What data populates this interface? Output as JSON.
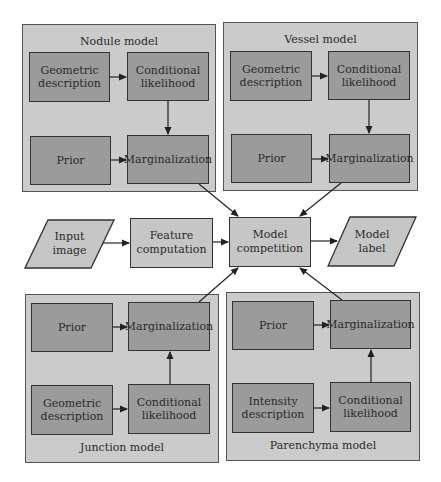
{
  "panels": {
    "nodule": {
      "title": "Nodule model",
      "boxes": {
        "description": "Geometric description",
        "likelihood": "Conditional likelihood",
        "prior": "Prior",
        "marginalization": "Marginalization"
      }
    },
    "vessel": {
      "title": "Vessel model",
      "boxes": {
        "description": "Geometric description",
        "likelihood": "Conditional likelihood",
        "prior": "Prior",
        "marginalization": "Marginalization"
      }
    },
    "junction": {
      "title": "Junction model",
      "boxes": {
        "description": "Geometric description",
        "likelihood": "Conditional likelihood",
        "prior": "Prior",
        "marginalization": "Marginalization"
      }
    },
    "parenchyma": {
      "title": "Parenchyma model",
      "boxes": {
        "description": "Intensity description",
        "likelihood": "Conditional likelihood",
        "prior": "Prior",
        "marginalization": "Marginalization"
      }
    }
  },
  "pipeline": {
    "input": "Input image",
    "feature": "Feature computation",
    "competition": "Model competition",
    "output": "Model label"
  },
  "colors": {
    "panel_fill": "#cbcbcb",
    "inner_box_fill": "#9b9b9b",
    "pipeline_fill": "#c6c6c6",
    "stroke": "#333333"
  }
}
